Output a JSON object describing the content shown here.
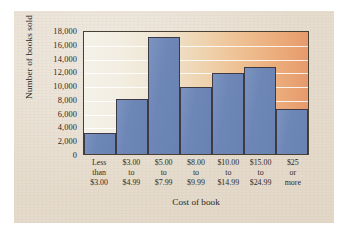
{
  "chart_data": {
    "type": "bar",
    "title": "",
    "xlabel": "Cost of book",
    "ylabel": "Number of books sold",
    "categories": [
      "Less than $3.00",
      "$3.00 to $4.99",
      "$5.00 to $7.99",
      "$8.00 to $9.99",
      "$10.00 to $14.99",
      "$15.00 to $24.99",
      "$25 or more"
    ],
    "category_lines": [
      [
        "Less",
        "than",
        "$3.00"
      ],
      [
        "$3.00",
        "to",
        "$4.99"
      ],
      [
        "$5.00",
        "to",
        "$7.99"
      ],
      [
        "$8.00",
        "to",
        "$9.99"
      ],
      [
        "$10.00",
        "to",
        "$14.99"
      ],
      [
        "$15.00",
        "to",
        "$24.99"
      ],
      [
        "$25",
        "or",
        "more"
      ]
    ],
    "values": [
      3000,
      8000,
      17000,
      9800,
      11700,
      12700,
      6500
    ],
    "ylim": [
      0,
      18000
    ],
    "ytick_labels": [
      "18,000",
      "16,000",
      "14,000",
      "12,000",
      "10,000",
      "8,000",
      "6,000",
      "4,000",
      "2,000",
      "0"
    ],
    "ytick_values": [
      18000,
      16000,
      14000,
      12000,
      10000,
      8000,
      6000,
      4000,
      2000,
      0
    ],
    "grid": true,
    "legend": "none",
    "bar_color": "#6d86b6",
    "bar_edge_color": "#3d3a46",
    "frame_color": "#4a3f33",
    "gridline_color": "#ffffff",
    "plot_bg_gradient_from": "#f4f1e8",
    "plot_bg_gradient_to": "#e79a6c",
    "paper_color": "#e6dccd"
  }
}
